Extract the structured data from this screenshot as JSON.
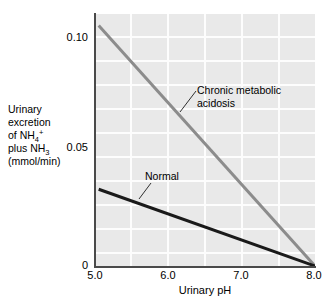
{
  "figure": {
    "background_color": "#ffffff",
    "plot_background_color": "#e9e9e9",
    "gridline_color": "#fdfdfd",
    "axis_color": "#4a4a4a"
  },
  "axes": {
    "x_title": "Urinary pH",
    "x_ticks": [
      "5.0",
      "6.0",
      "7.0",
      "8.0"
    ],
    "y_ticks": [
      "0.10",
      "0.05",
      "0"
    ],
    "y_title_lines": [
      "Urinary",
      "excretion",
      "of NH4+",
      "plus NH3",
      "(mmol/min)"
    ],
    "y_title_plain": "Urinary excretion of NH4+ plus NH3 (mmol/min)"
  },
  "annotations": {
    "acidosis_line1": "Chronic metabolic",
    "acidosis_line2": "acidosis",
    "normal": "Normal"
  },
  "chart_data": {
    "type": "line",
    "title": "",
    "xlabel": "Urinary pH",
    "ylabel": "Urinary excretion of NH4+ plus NH3 (mmol/min)",
    "xlim": [
      5.0,
      8.0
    ],
    "ylim": [
      0,
      0.11
    ],
    "xticks": [
      5.0,
      6.0,
      7.0,
      8.0
    ],
    "yticks": [
      0,
      0.05,
      0.1
    ],
    "grid": true,
    "legend": "in-plot annotations",
    "series": [
      {
        "name": "Chronic metabolic acidosis",
        "color": "#8c8c8c",
        "linewidth": 3,
        "x": [
          5.05,
          8.0
        ],
        "y": [
          0.105,
          0.0
        ]
      },
      {
        "name": "Normal",
        "color": "#1a1a1a",
        "linewidth": 3,
        "x": [
          5.05,
          8.0
        ],
        "y": [
          0.0335,
          0.0
        ]
      }
    ]
  }
}
